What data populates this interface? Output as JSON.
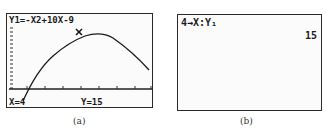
{
  "panel_a": {
    "equation": "Y1=-X2+10X-9",
    "x_readout": "X=4",
    "y_readout": "Y=15",
    "caption": "(a)",
    "trace_point": {
      "x": 4,
      "y": 15
    },
    "function": "-x^2+10x-9"
  },
  "panel_b": {
    "command": "4→X:Y₁",
    "result": "15",
    "caption": "(b)"
  }
}
